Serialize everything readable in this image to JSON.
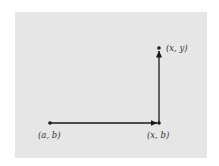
{
  "diagram": {
    "background_color": "#e6e6e6",
    "line_color": "#1a1a1a",
    "points": [
      {
        "id": "a-b",
        "label": "(a, b)",
        "x": 50,
        "y": 123
      },
      {
        "id": "x-b",
        "label": "(x, b)",
        "x": 159,
        "y": 123
      },
      {
        "id": "x-y",
        "label": "(x, y)",
        "x": 159,
        "y": 48
      }
    ],
    "arrows": [
      {
        "from": "a-b",
        "to": "x-b",
        "direction": "horizontal"
      },
      {
        "from": "x-b",
        "to": "x-y",
        "direction": "vertical"
      }
    ]
  }
}
